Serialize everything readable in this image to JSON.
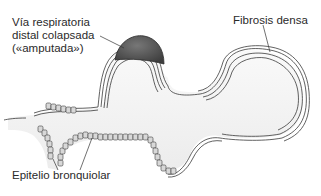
{
  "diagram": {
    "type": "histology-schematic",
    "labels": {
      "distal_airway_line1": "Vía respiratoria",
      "distal_airway_line2": "distal colapsada",
      "distal_airway_line3": "(«amputada»)",
      "fibrosis": "Fibrosis densa",
      "epithelium": "Epitelio bronquiolar"
    },
    "colors": {
      "outline": "#3a3a3a",
      "collapsed_airway_fill": "#5a5a5a",
      "lumen_fill": "#f4f4f4",
      "cell_fill": "#d8d8d8",
      "text": "#2a2a2a"
    }
  }
}
